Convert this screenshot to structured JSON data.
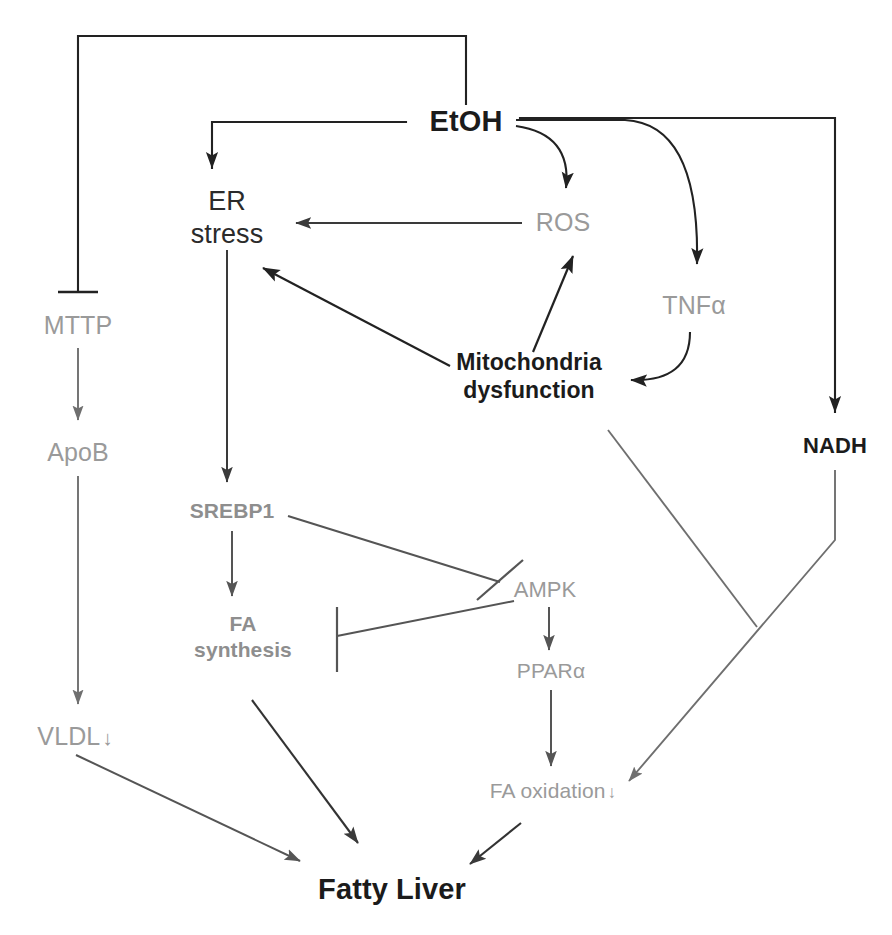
{
  "diagram": {
    "canvas": {
      "width": 892,
      "height": 935
    },
    "colors": {
      "black": "#1b1b1b",
      "dark": "#2b2b2b",
      "gray": "#9a9a9a",
      "gray_bold": "#8e8e8e",
      "edge_black": "#222222",
      "edge_gray": "#6f6f6f",
      "background": "#ffffff"
    },
    "nodes": [
      {
        "id": "etoh",
        "label": "EtOH",
        "label2": "",
        "x": 466,
        "y": 122,
        "style": "n-bold-black",
        "size": 29
      },
      {
        "id": "er",
        "label": "ER",
        "label2": "stress",
        "x": 227,
        "y": 218,
        "style": "n-plain-dark",
        "size": 27
      },
      {
        "id": "ros",
        "label": "ROS",
        "label2": "",
        "x": 563,
        "y": 222,
        "style": "n-gray",
        "size": 25
      },
      {
        "id": "tnfa",
        "label": "TNFα",
        "label2": "",
        "x": 694,
        "y": 305,
        "style": "n-gray",
        "size": 25
      },
      {
        "id": "mito",
        "label": "Mitochondria",
        "label2": "dysfunction",
        "x": 529,
        "y": 376,
        "style": "n-bold-black",
        "size": 23
      },
      {
        "id": "nadh",
        "label": "NADH",
        "label2": "",
        "x": 835,
        "y": 446,
        "style": "n-bold-black",
        "size": 22
      },
      {
        "id": "mttp",
        "label": "MTTP",
        "label2": "",
        "x": 78,
        "y": 325,
        "style": "n-gray",
        "size": 25
      },
      {
        "id": "apob",
        "label": "ApoB",
        "label2": "",
        "x": 78,
        "y": 452,
        "style": "n-gray",
        "size": 25
      },
      {
        "id": "vldl",
        "label": "VLDL",
        "label2": "",
        "x": 75,
        "y": 736,
        "style": "n-gray",
        "size": 25,
        "arrow": "↓"
      },
      {
        "id": "srebp1",
        "label": "SREBP1",
        "label2": "",
        "x": 232,
        "y": 511,
        "style": "n-gray-bold",
        "size": 21
      },
      {
        "id": "fasyn",
        "label": "FA",
        "label2": "synthesis",
        "x": 243,
        "y": 637,
        "style": "n-gray-bold",
        "size": 21
      },
      {
        "id": "ampk",
        "label": "AMPK",
        "label2": "",
        "x": 545,
        "y": 590,
        "style": "n-gray",
        "size": 22
      },
      {
        "id": "ppara",
        "label": "PPARα",
        "label2": "",
        "x": 551,
        "y": 671,
        "style": "n-gray",
        "size": 21
      },
      {
        "id": "faox",
        "label": "FA oxidation",
        "label2": "",
        "x": 553,
        "y": 791,
        "style": "n-gray",
        "size": 21,
        "arrow": "↓"
      },
      {
        "id": "fatty",
        "label": "Fatty Liver",
        "label2": "",
        "x": 392,
        "y": 890,
        "style": "n-bold-black",
        "size": 29
      }
    ],
    "edges": [
      {
        "id": "etoh-mttp",
        "from": "EtOH",
        "to": "MTTP",
        "kind": "inhibition",
        "color": "#222222"
      },
      {
        "id": "etoh-er",
        "from": "EtOH",
        "to": "ER stress",
        "kind": "arrow",
        "color": "#222222"
      },
      {
        "id": "etoh-ros",
        "from": "EtOH",
        "to": "ROS",
        "kind": "arrow",
        "color": "#222222"
      },
      {
        "id": "etoh-tnfa",
        "from": "EtOH",
        "to": "TNFα",
        "kind": "arrow",
        "color": "#222222"
      },
      {
        "id": "etoh-nadh",
        "from": "EtOH",
        "to": "NADH",
        "kind": "arrow",
        "color": "#222222"
      },
      {
        "id": "ros-er",
        "from": "ROS",
        "to": "ER stress",
        "kind": "arrow",
        "color": "#444444"
      },
      {
        "id": "mito-er",
        "from": "Mitochondria dysfunction",
        "to": "ER stress",
        "kind": "arrow",
        "color": "#222222"
      },
      {
        "id": "mito-ros",
        "from": "Mitochondria dysfunction",
        "to": "ROS",
        "kind": "arrow",
        "color": "#222222"
      },
      {
        "id": "tnfa-mito",
        "from": "TNFα",
        "to": "Mitochondria dysfunction",
        "kind": "arrow",
        "color": "#222222"
      },
      {
        "id": "mttp-apob",
        "from": "MTTP",
        "to": "ApoB",
        "kind": "arrow",
        "color": "#6f6f6f"
      },
      {
        "id": "apob-vldl",
        "from": "ApoB",
        "to": "VLDL",
        "kind": "arrow",
        "color": "#6f6f6f"
      },
      {
        "id": "er-srebp1",
        "from": "ER stress",
        "to": "SREBP1",
        "kind": "arrow",
        "color": "#444444"
      },
      {
        "id": "srebp1-fasyn",
        "from": "SREBP1",
        "to": "FA synthesis",
        "kind": "arrow",
        "color": "#555555"
      },
      {
        "id": "srebp1-ampk",
        "from": "SREBP1",
        "to": "AMPK",
        "kind": "inhibition",
        "color": "#555555"
      },
      {
        "id": "ampk-fasyn",
        "from": "AMPK",
        "to": "FA synthesis",
        "kind": "inhibition",
        "color": "#555555"
      },
      {
        "id": "ampk-ppara",
        "from": "AMPK",
        "to": "PPARα",
        "kind": "arrow",
        "color": "#555555"
      },
      {
        "id": "ppara-faox",
        "from": "PPARα",
        "to": "FA oxidation",
        "kind": "arrow",
        "color": "#555555"
      },
      {
        "id": "nadh-faox",
        "from": "NADH",
        "to": "FA oxidation",
        "kind": "arrow",
        "color": "#6f6f6f"
      },
      {
        "id": "mito-nadhline",
        "from": "Mitochondria dysfunction",
        "to": "NADH→FA oxidation",
        "kind": "inhibition",
        "color": "#6f6f6f"
      },
      {
        "id": "vldl-fatty",
        "from": "VLDL",
        "to": "Fatty Liver",
        "kind": "arrow",
        "color": "#555555"
      },
      {
        "id": "fasyn-fatty",
        "from": "FA synthesis",
        "to": "Fatty Liver",
        "kind": "arrow",
        "color": "#333333"
      },
      {
        "id": "faox-fatty",
        "from": "FA oxidation",
        "to": "Fatty Liver",
        "kind": "arrow",
        "color": "#333333"
      }
    ]
  }
}
